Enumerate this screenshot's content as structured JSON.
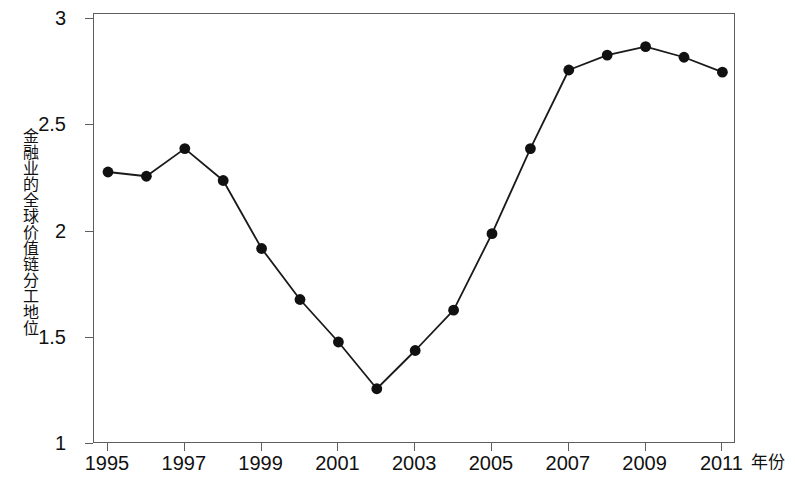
{
  "chart_data": {
    "type": "line",
    "title": "",
    "xlabel": "年份",
    "ylabel": "金融业的全球价值链分工地位",
    "x": [
      1995,
      1996,
      1997,
      1998,
      1999,
      2000,
      2001,
      2002,
      2003,
      2004,
      2005,
      2006,
      2007,
      2008,
      2009,
      2010,
      2011
    ],
    "values": [
      2.28,
      2.26,
      2.39,
      2.24,
      1.92,
      1.68,
      1.48,
      1.26,
      1.44,
      1.63,
      1.99,
      2.39,
      2.76,
      2.83,
      2.87,
      2.82,
      2.75
    ],
    "series": [
      {
        "name": "金融业的全球价值链分工地位",
        "values": [
          2.28,
          2.26,
          2.39,
          2.24,
          1.92,
          1.68,
          1.48,
          1.26,
          1.44,
          1.63,
          1.99,
          2.39,
          2.76,
          2.83,
          2.87,
          2.82,
          2.75
        ]
      }
    ],
    "xlim": [
      1994.63,
      1994.63
    ],
    "ylim": [
      1,
      3.05
    ],
    "xticks": [
      1995,
      1997,
      1999,
      2001,
      2003,
      2005,
      2007,
      2009,
      2011
    ],
    "xtick_labels": [
      "1995",
      "1997",
      "1999",
      "2001",
      "2003",
      "2005",
      "2007",
      "2009",
      "2011"
    ],
    "yticks": [
      1,
      1.5,
      2,
      2.5,
      3
    ],
    "ytick_labels": [
      "1",
      "1.5",
      "2",
      "2.5",
      "3"
    ],
    "grid": false,
    "legend": false,
    "legend_position": "none",
    "marker": "filled-circle",
    "marker_color": "#111111",
    "line_color": "#1a1a1a",
    "frame_color": "#5e5e5e",
    "background": "#ffffff"
  }
}
